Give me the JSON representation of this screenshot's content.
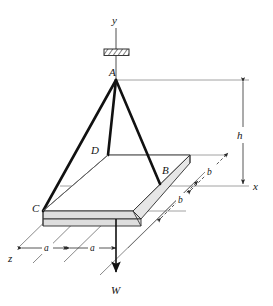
{
  "figure": {
    "type": "engineering-diagram",
    "background_color": "#ffffff",
    "line_color": "#141414",
    "plate_fill_color": "#dedede"
  },
  "axes": [
    {
      "id": "y",
      "label": "y",
      "direction": "up",
      "x": 116,
      "y": 20
    },
    {
      "id": "x",
      "label": "x",
      "direction": "right",
      "x": 256,
      "y": 186
    },
    {
      "id": "z",
      "label": "z",
      "direction": "down-left",
      "x": 11,
      "y": 259
    }
  ],
  "points": [
    {
      "id": "A",
      "label": "A",
      "x": 109,
      "y": 73,
      "role": "support-attachment"
    },
    {
      "id": "B",
      "label": "B",
      "x": 164,
      "y": 170,
      "role": "plate-corner"
    },
    {
      "id": "C",
      "label": "C",
      "x": 36,
      "y": 209,
      "role": "plate-corner"
    },
    {
      "id": "D",
      "label": "D",
      "x": 94,
      "y": 151,
      "role": "plate-corner"
    }
  ],
  "dimensions": [
    {
      "id": "h",
      "label": "h",
      "orientation": "vertical",
      "x": 238,
      "y": 135
    },
    {
      "id": "a-left",
      "label": "a",
      "orientation": "diagonal",
      "x": 47,
      "y": 251
    },
    {
      "id": "a-right",
      "label": "a",
      "orientation": "diagonal",
      "x": 93,
      "y": 251
    },
    {
      "id": "b-upper",
      "label": "b",
      "orientation": "diagonal",
      "x": 212,
      "y": 172
    },
    {
      "id": "b-lower",
      "label": "b",
      "orientation": "diagonal",
      "x": 183,
      "y": 199
    }
  ],
  "load": {
    "label": "W",
    "label_x": 112,
    "label_y": 291,
    "direction": "down",
    "from_y": 226,
    "to_y": 276
  },
  "support": {
    "type": "fixed-hatched-ceiling",
    "x": 104,
    "y": 49,
    "width": 25,
    "height": 7
  }
}
